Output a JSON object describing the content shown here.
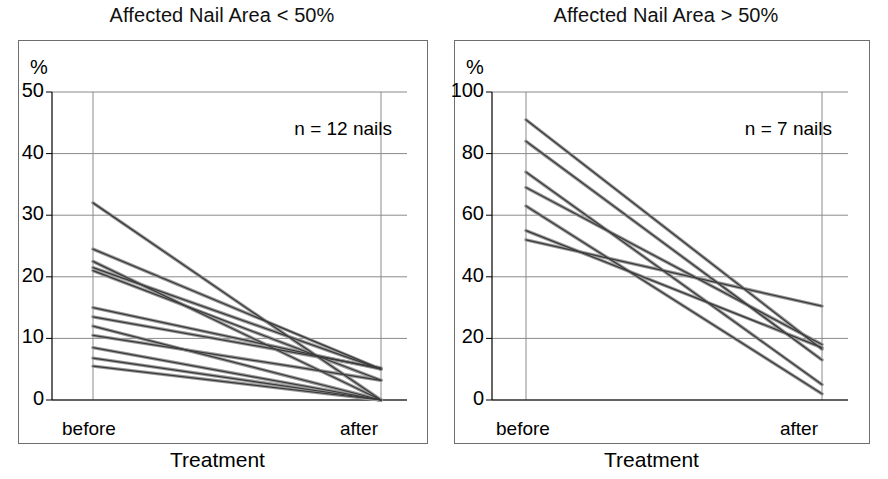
{
  "figure": {
    "background_color": "#ffffff",
    "line_color": "#555555",
    "frame_color": "#6f6f6f",
    "grid_color": "#8a8a8a",
    "axis_title": "Treatment",
    "unit_symbol": "%"
  },
  "chart_data": [
    {
      "type": "line",
      "panel_id": "left",
      "title": "Affected Nail Area < 50%",
      "annotation": "n = 12 nails",
      "n": 12,
      "xlabel": "Treatment",
      "ylabel": "%",
      "categories": [
        "before",
        "after"
      ],
      "x": [
        "before",
        "after"
      ],
      "ylim": [
        0,
        50
      ],
      "yticks": [
        0,
        10,
        20,
        30,
        40,
        50
      ],
      "ytick_labels": [
        "0",
        "10",
        "20",
        "30",
        "40",
        "50"
      ],
      "grid": true,
      "legend": "none",
      "series": [
        {
          "name": "nail 1",
          "values": [
            32.0,
            0.0
          ]
        },
        {
          "name": "nail 2",
          "values": [
            24.5,
            5.0
          ]
        },
        {
          "name": "nail 3",
          "values": [
            22.5,
            0.0
          ]
        },
        {
          "name": "nail 4",
          "values": [
            21.5,
            5.0
          ]
        },
        {
          "name": "nail 5",
          "values": [
            21.0,
            3.2
          ]
        },
        {
          "name": "nail 6",
          "values": [
            15.0,
            5.0
          ]
        },
        {
          "name": "nail 7",
          "values": [
            13.5,
            5.2
          ]
        },
        {
          "name": "nail 8",
          "values": [
            12.0,
            0.0
          ]
        },
        {
          "name": "nail 9",
          "values": [
            10.5,
            3.2
          ]
        },
        {
          "name": "nail 10",
          "values": [
            8.5,
            0.0
          ]
        },
        {
          "name": "nail 11",
          "values": [
            6.8,
            0.0
          ]
        },
        {
          "name": "nail 12",
          "values": [
            5.5,
            0.0
          ]
        }
      ]
    },
    {
      "type": "line",
      "panel_id": "right",
      "title": "Affected Nail Area > 50%",
      "annotation": "n = 7 nails",
      "n": 7,
      "xlabel": "Treatment",
      "ylabel": "%",
      "categories": [
        "before",
        "after"
      ],
      "x": [
        "before",
        "after"
      ],
      "ylim": [
        0,
        100
      ],
      "yticks": [
        0,
        20,
        40,
        60,
        80,
        100
      ],
      "ytick_labels": [
        "0",
        "20",
        "40",
        "60",
        "80",
        "100"
      ],
      "grid": true,
      "legend": "none",
      "series": [
        {
          "name": "nail 1",
          "values": [
            91.0,
            16.5
          ]
        },
        {
          "name": "nail 2",
          "values": [
            84.0,
            13.0
          ]
        },
        {
          "name": "nail 3",
          "values": [
            74.0,
            5.0
          ]
        },
        {
          "name": "nail 4",
          "values": [
            69.0,
            18.0
          ]
        },
        {
          "name": "nail 5",
          "values": [
            63.0,
            2.0
          ]
        },
        {
          "name": "nail 6",
          "values": [
            55.0,
            17.0
          ]
        },
        {
          "name": "nail 7",
          "values": [
            52.0,
            30.5
          ]
        }
      ]
    }
  ]
}
